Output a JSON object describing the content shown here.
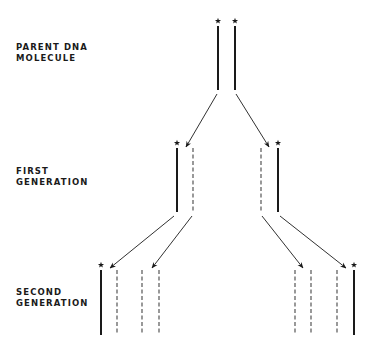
{
  "labels": {
    "parent": {
      "line1": "PARENT DNA",
      "line2": "MOLECULE"
    },
    "first": {
      "line1": "FIRST",
      "line2": "GENERATION"
    },
    "second": {
      "line1": "SECOND",
      "line2": "GENERATION"
    }
  },
  "legend_semantics": {
    "solid_strand": "original parental strand",
    "dashed_strand": "newly synthesized strand",
    "star": "marked (labeled) parental strand"
  },
  "generations": [
    {
      "name": "parent",
      "strands": [
        {
          "x": 218,
          "type": "solid",
          "star": true
        },
        {
          "x": 235,
          "type": "solid",
          "star": true
        }
      ],
      "y_top": 26,
      "y_bottom": 90
    },
    {
      "name": "first",
      "strands": [
        {
          "x": 177,
          "type": "solid",
          "star": true
        },
        {
          "x": 193,
          "type": "dashed",
          "star": false
        },
        {
          "x": 261,
          "type": "dashed",
          "star": false
        },
        {
          "x": 278,
          "type": "solid",
          "star": true
        }
      ],
      "y_top": 148,
      "y_bottom": 212
    },
    {
      "name": "second",
      "strands": [
        {
          "x": 101,
          "type": "solid",
          "star": true
        },
        {
          "x": 117,
          "type": "dashed",
          "star": false
        },
        {
          "x": 142,
          "type": "dashed",
          "star": false
        },
        {
          "x": 159,
          "type": "dashed",
          "star": false
        },
        {
          "x": 295,
          "type": "dashed",
          "star": false
        },
        {
          "x": 311,
          "type": "dashed",
          "star": false
        },
        {
          "x": 337,
          "type": "dashed",
          "star": false
        },
        {
          "x": 354,
          "type": "solid",
          "star": true
        }
      ],
      "y_top": 270,
      "y_bottom": 335
    }
  ],
  "arrows": [
    {
      "from": [
        217,
        94
      ],
      "to": [
        186,
        147
      ]
    },
    {
      "from": [
        236,
        94
      ],
      "to": [
        269,
        147
      ]
    },
    {
      "from": [
        174,
        216
      ],
      "to": [
        110,
        268
      ]
    },
    {
      "from": [
        192,
        216
      ],
      "to": [
        152,
        268
      ]
    },
    {
      "from": [
        262,
        216
      ],
      "to": [
        303,
        268
      ]
    },
    {
      "from": [
        280,
        216
      ],
      "to": [
        346,
        268
      ]
    }
  ],
  "colors": {
    "ink": "#1a1a1a",
    "dashed": "#555555",
    "background": "#ffffff"
  }
}
